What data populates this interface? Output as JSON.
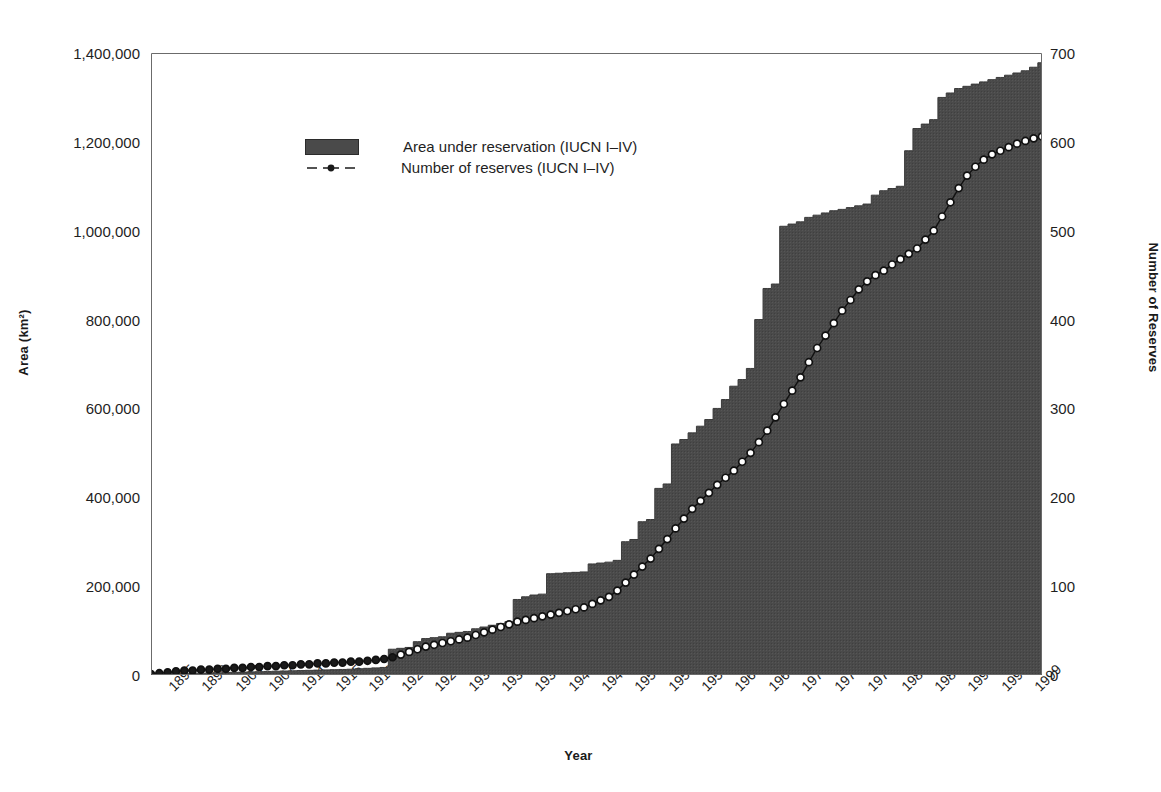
{
  "chart_data": {
    "type": "area",
    "title": "",
    "xlabel": "Year",
    "ylabel": "Area (km²)",
    "ylabel_right": "Number of Reserves",
    "grid": false,
    "legend_position": "upper-left-inside",
    "xlim": [
      1895,
      2002
    ],
    "ylim": [
      0,
      1400000
    ],
    "ylim_right": [
      0,
      700
    ],
    "ytick_labels": [
      "0",
      "200,000",
      "400,000",
      "600,000",
      "800,000",
      "1,000,000",
      "1,200,000",
      "1,400,000"
    ],
    "ytick_values": [
      0,
      200000,
      400000,
      600000,
      800000,
      1000000,
      1200000,
      1400000
    ],
    "ytick_right_labels": [
      "0",
      "100",
      "200",
      "300",
      "400",
      "500",
      "600",
      "700"
    ],
    "ytick_right_values": [
      0,
      100,
      200,
      300,
      400,
      500,
      600,
      700
    ],
    "xtick_labels": [
      "1895",
      "1899",
      "1903",
      "1907",
      "1911",
      "1915",
      "1919",
      "1923",
      "1927",
      "1931",
      "1935",
      "1939",
      "1943",
      "1947",
      "1951",
      "1955",
      "1959",
      "1963",
      "1967",
      "1971",
      "1975",
      "1979",
      "1983",
      "1987",
      "1991",
      "1995",
      "1999"
    ],
    "xtick_values": [
      1895,
      1899,
      1903,
      1907,
      1911,
      1915,
      1919,
      1923,
      1927,
      1931,
      1935,
      1939,
      1943,
      1947,
      1951,
      1955,
      1959,
      1963,
      1967,
      1971,
      1975,
      1979,
      1983,
      1987,
      1991,
      1995,
      1999
    ],
    "legend": [
      {
        "name": "Area under reservation (IUCN I–IV)",
        "marker": "area-swatch",
        "color": "#4a4a4a"
      },
      {
        "name": "Number of reserves (IUCN I–IV)",
        "marker": "line-circle",
        "color": "#1a1a1a"
      }
    ],
    "x": [
      1895,
      1896,
      1897,
      1898,
      1899,
      1900,
      1901,
      1902,
      1903,
      1904,
      1905,
      1906,
      1907,
      1908,
      1909,
      1910,
      1911,
      1912,
      1913,
      1914,
      1915,
      1916,
      1917,
      1918,
      1919,
      1920,
      1921,
      1922,
      1923,
      1924,
      1925,
      1926,
      1927,
      1928,
      1929,
      1930,
      1931,
      1932,
      1933,
      1934,
      1935,
      1936,
      1937,
      1938,
      1939,
      1940,
      1941,
      1942,
      1943,
      1944,
      1945,
      1946,
      1947,
      1948,
      1949,
      1950,
      1951,
      1952,
      1953,
      1954,
      1955,
      1956,
      1957,
      1958,
      1959,
      1960,
      1961,
      1962,
      1963,
      1964,
      1965,
      1966,
      1967,
      1968,
      1969,
      1970,
      1971,
      1972,
      1973,
      1974,
      1975,
      1976,
      1977,
      1978,
      1979,
      1980,
      1981,
      1982,
      1983,
      1984,
      1985,
      1986,
      1987,
      1988,
      1989,
      1990,
      1991,
      1992,
      1993,
      1994,
      1995,
      1996,
      1997,
      1998,
      1999,
      2000,
      2001,
      2002
    ],
    "series": [
      {
        "name": "Area under reservation (IUCN I–IV)",
        "axis": "left",
        "unit": "km2",
        "color": "#4a4a4a",
        "values": [
          1000,
          1500,
          2000,
          2500,
          3000,
          3500,
          4000,
          4500,
          5000,
          5500,
          6000,
          6500,
          7000,
          7500,
          8000,
          8500,
          9000,
          9500,
          10000,
          10500,
          11000,
          11500,
          12000,
          12500,
          13000,
          14000,
          15000,
          16000,
          17000,
          58000,
          60000,
          62000,
          75000,
          82000,
          84000,
          86000,
          94000,
          96000,
          98000,
          104000,
          108000,
          112000,
          116000,
          120000,
          170000,
          176000,
          180000,
          182000,
          228000,
          229000,
          230000,
          231000,
          232000,
          250000,
          252000,
          254000,
          258000,
          300000,
          305000,
          345000,
          350000,
          420000,
          430000,
          520000,
          530000,
          545000,
          560000,
          575000,
          600000,
          620000,
          650000,
          665000,
          690000,
          800000,
          870000,
          880000,
          1010000,
          1015000,
          1020000,
          1030000,
          1035000,
          1040000,
          1045000,
          1048000,
          1052000,
          1056000,
          1060000,
          1080000,
          1090000,
          1095000,
          1100000,
          1180000,
          1230000,
          1240000,
          1250000,
          1300000,
          1310000,
          1320000,
          1325000,
          1330000,
          1335000,
          1340000,
          1345000,
          1350000,
          1355000,
          1360000,
          1368000,
          1378000
        ]
      },
      {
        "name": "Number of reserves (IUCN I–IV)",
        "axis": "right",
        "unit": "count",
        "color": "#1a1a1a",
        "marker": "circle-open",
        "values": [
          1,
          2,
          3,
          4,
          5,
          5,
          6,
          6,
          7,
          7,
          8,
          8,
          9,
          9,
          10,
          10,
          11,
          11,
          12,
          12,
          13,
          13,
          14,
          14,
          15,
          15,
          16,
          17,
          18,
          20,
          23,
          26,
          29,
          32,
          34,
          36,
          38,
          40,
          42,
          45,
          48,
          51,
          54,
          57,
          60,
          62,
          64,
          66,
          68,
          70,
          72,
          74,
          76,
          80,
          84,
          88,
          95,
          104,
          113,
          122,
          131,
          142,
          153,
          165,
          176,
          187,
          196,
          205,
          214,
          222,
          230,
          240,
          250,
          262,
          275,
          290,
          305,
          320,
          335,
          352,
          368,
          382,
          396,
          410,
          422,
          434,
          443,
          450,
          455,
          462,
          468,
          474,
          480,
          490,
          500,
          516,
          532,
          548,
          562,
          572,
          580,
          586,
          590,
          594,
          598,
          601,
          604,
          606
        ]
      }
    ]
  }
}
